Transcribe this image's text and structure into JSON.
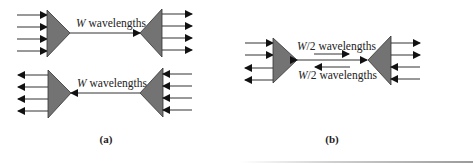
{
  "figure": {
    "panel_a": {
      "caption": "(a)",
      "top_link": {
        "label_italic": "W",
        "label_rest": " wavelengths",
        "direction": "left-to-right"
      },
      "bottom_link": {
        "label_italic": "W",
        "label_rest": " wavelengths",
        "direction": "right-to-left"
      },
      "ports_per_side": 4
    },
    "panel_b": {
      "caption": "(b)",
      "upper_label": {
        "label_italic": "W",
        "label_rest": "/2 wavelengths",
        "direction": "left-to-right"
      },
      "lower_label": {
        "label_italic": "W",
        "label_rest": "/2 wavelengths",
        "direction": "right-to-left"
      },
      "link": "bidirectional",
      "ports_per_side": 4
    },
    "colors": {
      "triangle_fill": "#737373",
      "line": "#333333"
    }
  }
}
